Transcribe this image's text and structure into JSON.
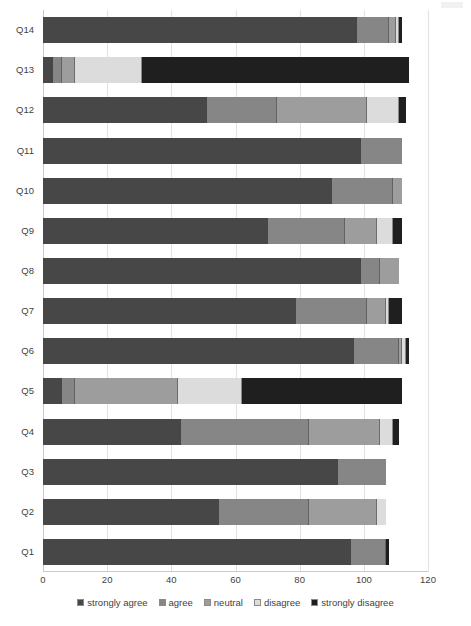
{
  "chart_data": {
    "type": "bar",
    "orientation": "horizontal",
    "stacked": true,
    "title": "",
    "xlabel": "",
    "ylabel": "",
    "xlim": [
      0,
      120
    ],
    "xticks": [
      0,
      20,
      40,
      60,
      80,
      100,
      120
    ],
    "xtick_labels": [
      "0",
      "20",
      "40",
      "60",
      "80",
      "100",
      "120"
    ],
    "grid": true,
    "grid_axis": "x",
    "legend_position": "bottom",
    "categories": [
      "Q1",
      "Q2",
      "Q3",
      "Q4",
      "Q5",
      "Q6",
      "Q7",
      "Q8",
      "Q9",
      "Q10",
      "Q11",
      "Q12",
      "Q13",
      "Q14"
    ],
    "category_order_top_to_bottom": [
      "Q14",
      "Q13",
      "Q12",
      "Q11",
      "Q10",
      "Q9",
      "Q8",
      "Q7",
      "Q6",
      "Q5",
      "Q4",
      "Q3",
      "Q2",
      "Q1"
    ],
    "series": [
      {
        "name": "strongly agree",
        "color": "#474747",
        "values": [
          96,
          55,
          92,
          43,
          6,
          97,
          79,
          99,
          70,
          90,
          99,
          51,
          3,
          98
        ]
      },
      {
        "name": "agree",
        "color": "#868686",
        "values": [
          11,
          28,
          15,
          40,
          4,
          14,
          22,
          6,
          24,
          19,
          13,
          22,
          3,
          10
        ]
      },
      {
        "name": "neutral",
        "color": "#9d9d9d",
        "values": [
          0,
          21,
          0,
          22,
          32,
          1,
          6,
          6,
          10,
          3,
          0,
          28,
          4,
          2
        ]
      },
      {
        "name": "disagree",
        "color": "#dcdcdc",
        "values": [
          0,
          3,
          0,
          4,
          20,
          1,
          1,
          0,
          5,
          0,
          0,
          10,
          21,
          1
        ]
      },
      {
        "name": "strongly disagree",
        "color": "#1f1f1f",
        "values": [
          1,
          0,
          0,
          2,
          50,
          1,
          4,
          0,
          3,
          0,
          0,
          2,
          83,
          1
        ]
      }
    ],
    "totals": [
      108,
      107,
      107,
      111,
      112,
      114,
      112,
      111,
      112,
      112,
      112,
      113,
      114,
      112
    ]
  },
  "legend": {
    "items": [
      {
        "label": "strongly agree"
      },
      {
        "label": "agree"
      },
      {
        "label": "neutral"
      },
      {
        "label": "disagree"
      },
      {
        "label": "strongly disagree"
      }
    ]
  }
}
